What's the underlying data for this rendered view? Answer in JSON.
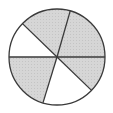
{
  "diagram": {
    "type": "pie-fraction",
    "center": [
      57,
      57
    ],
    "radius": 48,
    "colors": {
      "shaded": "#d2d2d2",
      "unshaded": "#ffffff",
      "stroke": "#3a3a3a"
    },
    "sectors": [
      {
        "start": 0,
        "end": 44,
        "shaded": true
      },
      {
        "start": 44,
        "end": 107,
        "shaded": false
      },
      {
        "start": 107,
        "end": 180,
        "shaded": true
      },
      {
        "start": 180,
        "end": 224,
        "shaded": false
      },
      {
        "start": 224,
        "end": 286,
        "shaded": true
      },
      {
        "start": 286,
        "end": 360,
        "shaded": true
      }
    ],
    "shaded_count": 4,
    "total_count": 6
  }
}
